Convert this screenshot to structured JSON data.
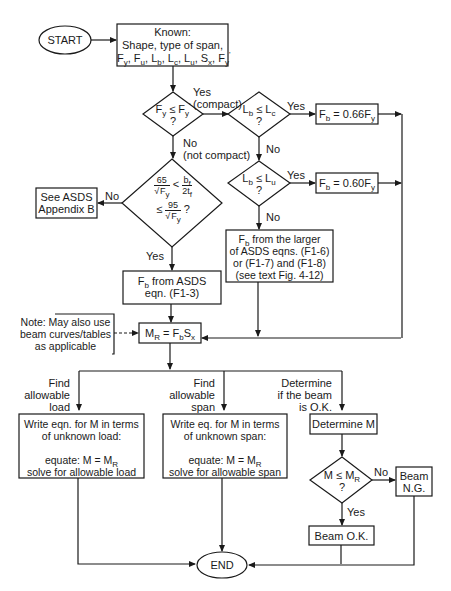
{
  "diagram": {
    "type": "flowchart",
    "nodes": {
      "start": "START",
      "known_title": "Known:",
      "known_line1": "Shape, type of span,",
      "known_vars": "Fy, Fu, Lb, Lc, Lu, Sx, Fy'",
      "compact_check": "Fy ≤ Fy' ?",
      "lb_lc_check": "Lb ≤ Lc ?",
      "lb_lu_check": "Lb ≤ Lu ?",
      "fb_066": "Fb = 0.66Fy",
      "fb_060": "Fb = 0.60Fy",
      "flange_check": "65/√Fy < bf/2tf ≤ 95/√Fy ?",
      "see_appendix_line1": "See ASDS",
      "see_appendix_line2": "Appendix B",
      "fb_f13_line1": "Fb from ASDS",
      "fb_f13_line2": "eqn. (F1-3)",
      "fb_larger_line1": "Fb from the larger",
      "fb_larger_line2": "of ASDS eqns. (F1-6)",
      "fb_larger_line3": "or (F1-7) and (F1-8)",
      "fb_larger_line4": "(see text Fig. 4-12)",
      "note_line1": "Note: May also use",
      "note_line2": "beam curves/tables",
      "note_line3": "as applicable",
      "mr_eq": "MR = FbSx",
      "branch_load": [
        "Find",
        "allowable",
        "load"
      ],
      "branch_span": [
        "Find",
        "allowable",
        "span"
      ],
      "branch_ok": [
        "Determine",
        "if the beam",
        "is O.K."
      ],
      "load_box": [
        "Write eqn. for M in terms",
        "of unknown load:",
        "",
        "equate: M = MR",
        "solve for allowable load"
      ],
      "span_box": [
        "Write eq. for M in terms",
        "of unknown span:",
        "",
        "equate: M = MR",
        "solve for allowable span"
      ],
      "determine_m": "Determine M",
      "m_check": "M ≤ MR ?",
      "beam_ng_line1": "Beam",
      "beam_ng_line2": "N.G.",
      "beam_ok": "Beam O.K.",
      "end": "END"
    },
    "edge_labels": {
      "yes": "Yes",
      "no": "No",
      "compact": "(compact)",
      "not_compact": "(not compact)"
    }
  }
}
